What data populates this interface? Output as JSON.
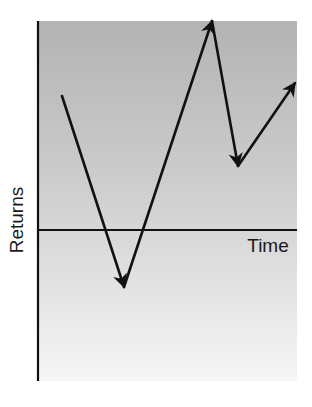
{
  "diagram": {
    "type": "returns-over-time",
    "y_axis_label": "Returns",
    "x_axis_label": "Time",
    "colors": {
      "background_top": "#b3b3b3",
      "background_bottom": "#f6f6f6",
      "line": "#111111",
      "axis": "#111111"
    },
    "path_points": [
      {
        "x": 62,
        "y": 96
      },
      {
        "x": 124,
        "y": 287
      },
      {
        "x": 212,
        "y": 21
      },
      {
        "x": 238,
        "y": 166
      },
      {
        "x": 295,
        "y": 83
      }
    ],
    "segments": [
      {
        "direction": "down",
        "label": "decline below zero"
      },
      {
        "direction": "up",
        "label": "rise to peak"
      },
      {
        "direction": "down",
        "label": "pullback"
      },
      {
        "direction": "up",
        "label": "recovery"
      }
    ]
  },
  "chart_data": {
    "type": "line",
    "title": "",
    "xlabel": "Time",
    "ylabel": "Returns",
    "x": [
      0,
      1,
      2,
      3,
      4
    ],
    "values": [
      0.6,
      -0.25,
      0.9,
      0.3,
      0.6
    ],
    "annotations": [
      "Arrows indicate direction of each return movement",
      "Horizontal line marks zero return"
    ],
    "grid": false,
    "legend": null
  }
}
